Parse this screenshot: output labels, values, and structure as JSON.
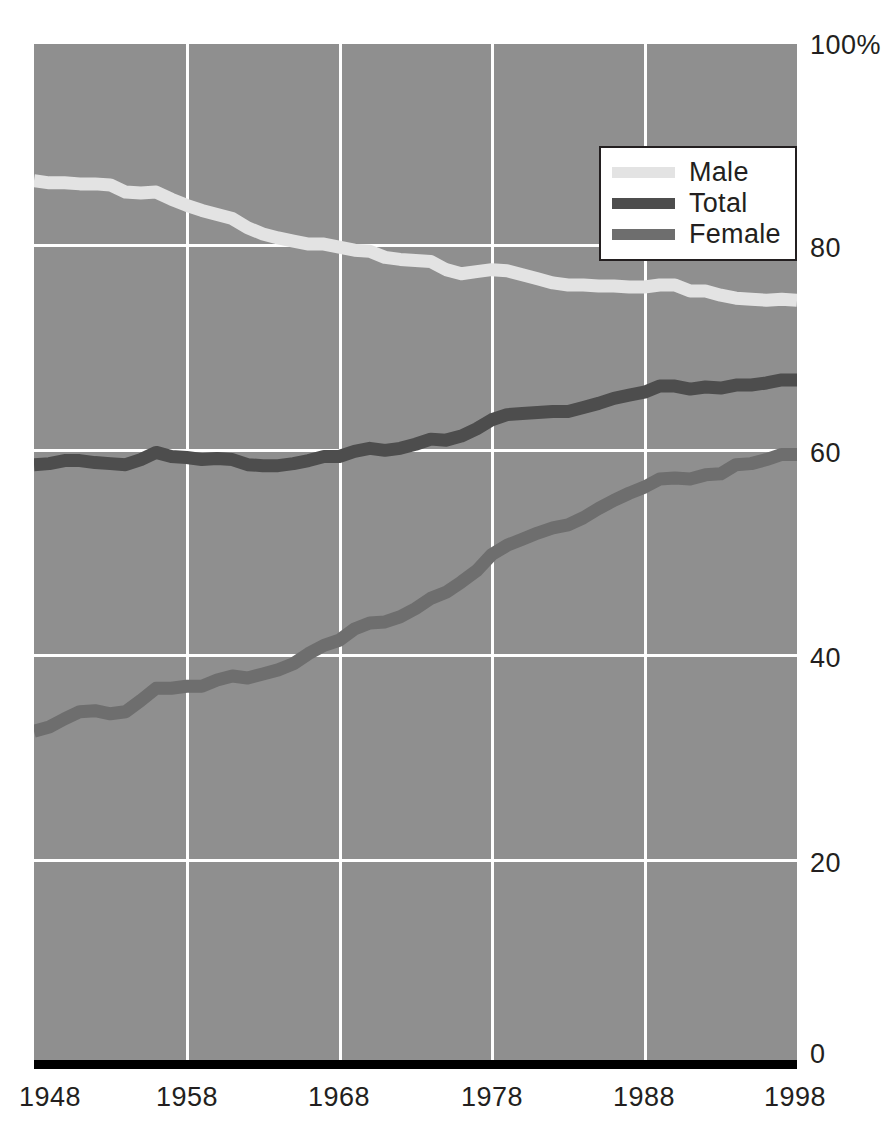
{
  "chart_data": {
    "type": "line",
    "title": "",
    "subtitle": "",
    "xlabel": "",
    "ylabel": "",
    "xlim": [
      1948,
      1998
    ],
    "ylim": [
      0,
      100
    ],
    "grid": true,
    "legend_position": "top-right-inside",
    "x_ticks": [
      "1948",
      "1958",
      "1968",
      "1978",
      "1988",
      "1998"
    ],
    "x_tick_values": [
      1948,
      1958,
      1968,
      1978,
      1988,
      1998
    ],
    "y_ticks": [
      "0",
      "20",
      "40",
      "60",
      "80",
      "100%"
    ],
    "y_tick_values": [
      0,
      20,
      40,
      60,
      80,
      100
    ],
    "x": [
      1948,
      1949,
      1950,
      1951,
      1952,
      1953,
      1954,
      1955,
      1956,
      1957,
      1958,
      1959,
      1960,
      1961,
      1962,
      1963,
      1964,
      1965,
      1966,
      1967,
      1968,
      1969,
      1970,
      1971,
      1972,
      1973,
      1974,
      1975,
      1976,
      1977,
      1978,
      1979,
      1980,
      1981,
      1982,
      1983,
      1984,
      1985,
      1986,
      1987,
      1988,
      1989,
      1990,
      1991,
      1992,
      1993,
      1994,
      1995,
      1996,
      1997,
      1998
    ],
    "series": [
      {
        "name": "Male",
        "color": "#e3e3e3",
        "values": [
          86.6,
          86.4,
          86.4,
          86.3,
          86.3,
          86.2,
          85.5,
          85.4,
          85.5,
          84.8,
          84.2,
          83.7,
          83.3,
          82.9,
          82.0,
          81.4,
          81.0,
          80.7,
          80.4,
          80.4,
          80.1,
          79.8,
          79.7,
          79.1,
          78.9,
          78.8,
          78.7,
          77.9,
          77.5,
          77.7,
          77.9,
          77.8,
          77.4,
          77.0,
          76.6,
          76.4,
          76.4,
          76.3,
          76.3,
          76.2,
          76.2,
          76.4,
          76.4,
          75.8,
          75.8,
          75.4,
          75.1,
          75.0,
          74.9,
          75.0,
          74.9
        ]
      },
      {
        "name": "Total",
        "color": "#4d4d4d",
        "values": [
          58.8,
          58.9,
          59.2,
          59.2,
          59.0,
          58.9,
          58.8,
          59.3,
          60.0,
          59.6,
          59.5,
          59.3,
          59.4,
          59.3,
          58.8,
          58.7,
          58.7,
          58.9,
          59.2,
          59.6,
          59.6,
          60.1,
          60.4,
          60.2,
          60.4,
          60.8,
          61.3,
          61.2,
          61.6,
          62.3,
          63.2,
          63.7,
          63.8,
          63.9,
          64.0,
          64.0,
          64.4,
          64.8,
          65.3,
          65.6,
          65.9,
          66.5,
          66.5,
          66.2,
          66.4,
          66.3,
          66.6,
          66.6,
          66.8,
          67.1,
          67.1
        ]
      },
      {
        "name": "Female",
        "color": "#6e6e6e",
        "values": [
          32.7,
          33.1,
          33.9,
          34.6,
          34.7,
          34.4,
          34.6,
          35.7,
          36.9,
          36.9,
          37.1,
          37.1,
          37.7,
          38.1,
          37.9,
          38.3,
          38.7,
          39.3,
          40.3,
          41.1,
          41.6,
          42.7,
          43.3,
          43.4,
          43.9,
          44.7,
          45.7,
          46.3,
          47.3,
          48.4,
          50.0,
          50.9,
          51.5,
          52.1,
          52.6,
          52.9,
          53.6,
          54.5,
          55.3,
          56.0,
          56.6,
          57.4,
          57.5,
          57.4,
          57.8,
          57.9,
          58.8,
          58.9,
          59.3,
          59.8,
          59.8
        ]
      }
    ]
  },
  "legend": {
    "items": [
      {
        "label": "Male",
        "color": "#e3e3e3"
      },
      {
        "label": "Total",
        "color": "#4d4d4d"
      },
      {
        "label": "Female",
        "color": "#6e6e6e"
      }
    ]
  },
  "axes": {
    "y_labels": [
      "100%",
      "80",
      "60",
      "40",
      "20",
      "0"
    ],
    "x_labels": [
      "1948",
      "1958",
      "1968",
      "1978",
      "1988",
      "1998"
    ]
  },
  "colors": {
    "plot_background": "#8f8f8f",
    "gridline": "#ffffff",
    "baseline": "#000000",
    "text": "#231f20"
  }
}
